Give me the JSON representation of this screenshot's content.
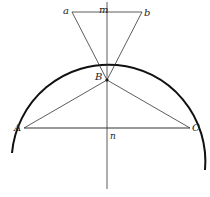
{
  "diagram": {
    "labels": {
      "a": "a",
      "m": "m",
      "b": "b",
      "B": "B",
      "A": "A",
      "n": "n",
      "C": "C"
    },
    "colors": {
      "line": "#333333",
      "arc": "#111111"
    }
  }
}
